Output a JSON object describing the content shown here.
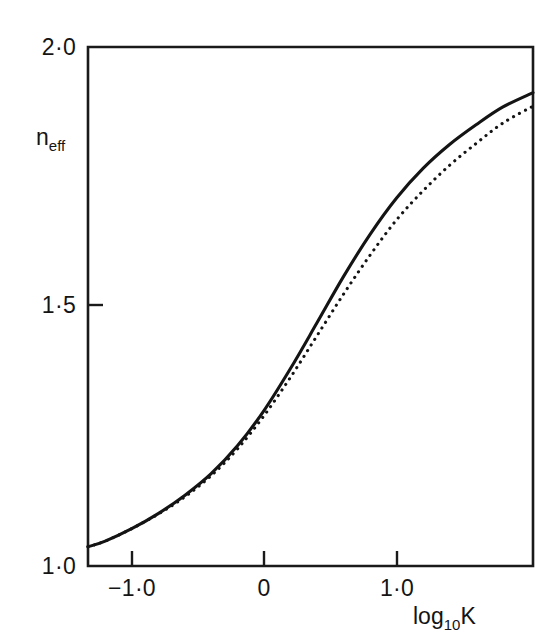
{
  "chart_data": {
    "type": "line",
    "title": "",
    "subtitle": "",
    "xlabel": "log₁₀K",
    "ylabel": "n_eff",
    "xlim": [
      -1.33,
      2.03
    ],
    "ylim": [
      1.0,
      2.0
    ],
    "grid": false,
    "legend_position": "none",
    "x_ticks": [
      -1.0,
      0.0,
      1.0
    ],
    "x_tick_labels": [
      "−1·0",
      "0",
      "1·0"
    ],
    "y_ticks": [
      1.0,
      1.5,
      2.0
    ],
    "y_tick_labels": [
      "1·0",
      "1·5",
      "2·0"
    ],
    "x": [
      -1.33,
      -1.2,
      -1.0,
      -0.8,
      -0.6,
      -0.4,
      -0.2,
      0.0,
      0.2,
      0.4,
      0.6,
      0.8,
      1.0,
      1.2,
      1.4,
      1.6,
      1.8,
      2.03
    ],
    "series": [
      {
        "name": "solid-curve",
        "style": "solid",
        "values": [
          1.037,
          1.048,
          1.072,
          1.101,
          1.136,
          1.178,
          1.232,
          1.3,
          1.381,
          1.469,
          1.558,
          1.639,
          1.709,
          1.766,
          1.812,
          1.85,
          1.884,
          1.912
        ]
      },
      {
        "name": "dotted-curve",
        "style": "dotted",
        "values": [
          1.037,
          1.048,
          1.072,
          1.1,
          1.133,
          1.174,
          1.226,
          1.29,
          1.364,
          1.444,
          1.524,
          1.599,
          1.667,
          1.723,
          1.772,
          1.814,
          1.853,
          1.886
        ]
      }
    ],
    "annotations": []
  },
  "axes": {
    "y_title_base": "n",
    "y_title_sub": "eff",
    "x_title_base": "log",
    "x_title_sub": "10",
    "x_title_tail": "K",
    "tick_labels": {
      "y_top": "2·0",
      "y_mid": "1·5",
      "y_bottom": "1·0",
      "x_left": "−1·0",
      "x_mid": "0",
      "x_right": "1·0"
    }
  },
  "colors": {
    "ink": "#141414",
    "frame": "#1a1a1a",
    "background": "#ffffff"
  }
}
